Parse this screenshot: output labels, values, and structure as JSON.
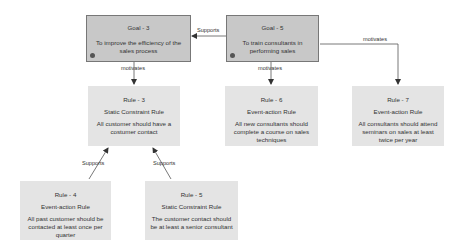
{
  "diagram": {
    "colors": {
      "goal_fill": "#c8c8c8",
      "goal_border": "#777777",
      "rule_fill": "#e4e4e4",
      "edge": "#555555"
    },
    "goals": [
      {
        "id": "goal3",
        "title": "Goal - 3",
        "description": "To improve the efficiency of the sales process",
        "icon": "gear-icon"
      },
      {
        "id": "goal5",
        "title": "Goal - 5",
        "description": "To train consultants in performing sales",
        "icon": "gear-icon"
      }
    ],
    "rules": [
      {
        "id": "rule3",
        "title": "Rule - 3",
        "type": "Static Constraint Rule",
        "description": "All customer should have a costumer contact"
      },
      {
        "id": "rule6",
        "title": "Rule - 6",
        "type": "Event-action Rule",
        "description": "All new consultants should complete a course on sales techniques"
      },
      {
        "id": "rule7",
        "title": "Rule - 7",
        "type": "Event-action Rule",
        "description": "All consultants should attend seminars on sales at least twice per year"
      },
      {
        "id": "rule4",
        "title": "Rule - 4",
        "type": "Event-action Rule",
        "description": "All past customer should be contacted at least once per quarter"
      },
      {
        "id": "rule5",
        "title": "Rule - 5",
        "type": "Static Constraint Rule",
        "description": "The customer contact should be at least a senior consultant"
      }
    ],
    "edges": [
      {
        "from": "goal5",
        "to": "goal3",
        "label": "Supports"
      },
      {
        "from": "goal3",
        "to": "rule3",
        "label": "motivates"
      },
      {
        "from": "goal5",
        "to": "rule6",
        "label": "motivates"
      },
      {
        "from": "goal5",
        "to": "rule7",
        "label": "motivates"
      },
      {
        "from": "rule4",
        "to": "rule3",
        "label": "Supports"
      },
      {
        "from": "rule5",
        "to": "rule3",
        "label": "Supports"
      }
    ]
  }
}
